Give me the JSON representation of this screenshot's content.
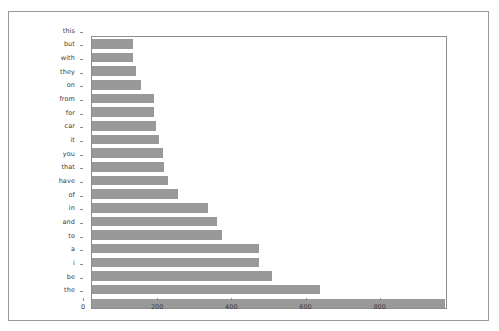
{
  "chart_data": {
    "type": "bar",
    "orientation": "horizontal",
    "title": "",
    "subtitle": "",
    "xlabel": "",
    "ylabel": "",
    "xlim": [
      0,
      960
    ],
    "ylim": [
      0,
      20
    ],
    "grid": false,
    "legend": null,
    "bar_color": "#999999",
    "frame_color": "#8d8d8d",
    "background": "#ffffff",
    "xticks": [
      0,
      200,
      400,
      600,
      800
    ],
    "xtick_labels": [
      "0",
      "200",
      "400",
      "600",
      "800"
    ],
    "categories": [
      "this",
      "but",
      "with",
      "they",
      "on",
      "from",
      "for",
      "car",
      "it",
      "you",
      "that",
      "have",
      "of",
      "in",
      "and",
      "to",
      "a",
      "i",
      "be",
      "the"
    ],
    "values": [
      111,
      111,
      119,
      131,
      167,
      167,
      172,
      181,
      192,
      195,
      206,
      231,
      314,
      336,
      350,
      450,
      450,
      486,
      614,
      953
    ]
  }
}
